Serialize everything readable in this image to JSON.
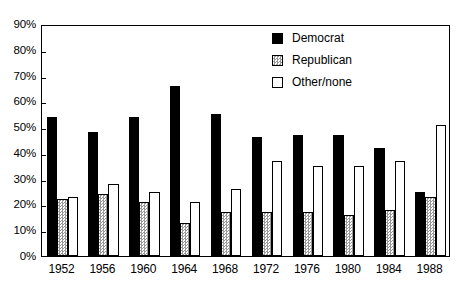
{
  "chart_data": {
    "type": "bar",
    "title": "",
    "subtitle": "",
    "xlabel": "",
    "ylabel": "",
    "ylim": [
      0,
      90
    ],
    "ytick_labels": [
      "0%",
      "10%",
      "20%",
      "30%",
      "40%",
      "50%",
      "60%",
      "70%",
      "80%",
      "90%"
    ],
    "ytick_values": [
      0,
      10,
      20,
      30,
      40,
      50,
      60,
      70,
      80,
      90
    ],
    "grid": false,
    "legend_position": "top-right",
    "categories": [
      "1952",
      "1956",
      "1960",
      "1964",
      "1968",
      "1972",
      "1976",
      "1980",
      "1984",
      "1988"
    ],
    "series": [
      {
        "name": "Democrat",
        "color": "#000000",
        "fill": "solid-black",
        "values": [
          54,
          48,
          54,
          66,
          55,
          46,
          47,
          47,
          42,
          25
        ]
      },
      {
        "name": "Republican",
        "color": "#9a9a9a",
        "fill": "checkered-gray",
        "values": [
          22,
          24,
          21,
          13,
          17,
          17,
          17,
          16,
          18,
          23
        ]
      },
      {
        "name": "Other/none",
        "color": "#ffffff",
        "fill": "white-outline",
        "values": [
          23,
          28,
          25,
          21,
          26,
          37,
          35,
          35,
          37,
          51
        ]
      }
    ]
  },
  "legend": {
    "items": [
      {
        "label": "Democrat",
        "swatch": "solid-black-swatch"
      },
      {
        "label": "Republican",
        "swatch": "checkered-gray-swatch"
      },
      {
        "label": "Other/none",
        "swatch": "white-outline-swatch"
      }
    ]
  }
}
